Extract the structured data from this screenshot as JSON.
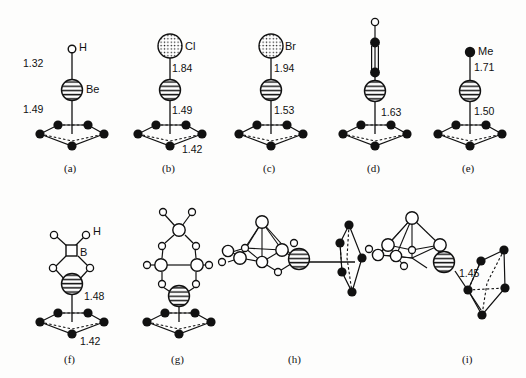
{
  "figure": {
    "caption": "",
    "colors": {
      "line": "#111111",
      "filled_atom": "#111111",
      "open_atom": "#ffffff",
      "background": "#fdfdfc"
    }
  },
  "panels": [
    {
      "id": "a",
      "label": "(a)",
      "formula": "CpBeH",
      "top_atom": {
        "symbol": "H",
        "style": "open-circle",
        "label": "H"
      },
      "metal": {
        "symbol": "Be",
        "style": "striped-sphere",
        "label": "Be"
      },
      "ring": {
        "type": "cyclopentadienyl",
        "atoms": 5,
        "style": "filled-circle"
      },
      "distances": [
        {
          "value": "1.32",
          "from": "Be",
          "to": "H"
        },
        {
          "value": "1.49",
          "from": "Be",
          "to": "ring"
        }
      ]
    },
    {
      "id": "b",
      "label": "(b)",
      "formula": "CpBeCl",
      "top_atom": {
        "symbol": "Cl",
        "style": "stippled-circle",
        "label": "Cl"
      },
      "metal": {
        "symbol": "Be",
        "style": "striped-sphere",
        "label": ""
      },
      "ring": {
        "type": "cyclopentadienyl",
        "atoms": 5,
        "style": "filled-circle"
      },
      "distances": [
        {
          "value": "1.84",
          "from": "Be",
          "to": "Cl"
        },
        {
          "value": "1.49",
          "from": "Be",
          "to": "ring"
        },
        {
          "value": "1.42",
          "from": "C",
          "to": "C"
        }
      ]
    },
    {
      "id": "c",
      "label": "(c)",
      "formula": "CpBeBr",
      "top_atom": {
        "symbol": "Br",
        "style": "stippled-circle",
        "label": "Br"
      },
      "metal": {
        "symbol": "Be",
        "style": "striped-sphere",
        "label": ""
      },
      "ring": {
        "type": "cyclopentadienyl",
        "atoms": 5,
        "style": "filled-circle"
      },
      "distances": [
        {
          "value": "1.94",
          "from": "Be",
          "to": "Br"
        },
        {
          "value": "1.53",
          "from": "Be",
          "to": "ring"
        }
      ]
    },
    {
      "id": "d",
      "label": "(d)",
      "formula": "CpBeC2H",
      "top_atom": {
        "symbol": "H",
        "style": "open-circle",
        "label": ""
      },
      "metal": {
        "symbol": "Be",
        "style": "striped-sphere",
        "label": ""
      },
      "ring": {
        "type": "cyclopentadienyl",
        "atoms": 5,
        "style": "filled-circle"
      },
      "substituent": {
        "type": "acetylide",
        "bond": "triple"
      },
      "distances": [
        {
          "value": "1.63",
          "from": "Be",
          "to": "ring"
        }
      ]
    },
    {
      "id": "e",
      "label": "(e)",
      "formula": "CpBeMe",
      "top_atom": {
        "symbol": "Me",
        "style": "filled-circle",
        "label": "Me"
      },
      "metal": {
        "symbol": "Be",
        "style": "striped-sphere",
        "label": ""
      },
      "ring": {
        "type": "cyclopentadienyl",
        "atoms": 5,
        "style": "filled-circle"
      },
      "distances": [
        {
          "value": "1.71",
          "from": "Be",
          "to": "Me"
        },
        {
          "value": "1.50",
          "from": "Be",
          "to": "ring"
        }
      ]
    },
    {
      "id": "f",
      "label": "(f)",
      "formula": "CpBeBH4",
      "top_atom": {
        "symbol": "B",
        "style": "open-square",
        "label": "B"
      },
      "metal": {
        "symbol": "Be",
        "style": "striped-sphere",
        "label": ""
      },
      "ring": {
        "type": "cyclopentadienyl",
        "atoms": 5,
        "style": "filled-circle"
      },
      "substituent": {
        "type": "borohydride",
        "hydrogen_label": "H"
      },
      "distances": [
        {
          "value": "1.48",
          "from": "Be",
          "to": "ring"
        },
        {
          "value": "1.42",
          "from": "C",
          "to": "C"
        }
      ]
    },
    {
      "id": "g",
      "label": "(g)",
      "formula": "CpBeB3H8",
      "metal": {
        "symbol": "Be",
        "style": "striped-sphere",
        "label": ""
      },
      "ring": {
        "type": "cyclopentadienyl",
        "atoms": 5,
        "style": "filled-circle"
      },
      "substituent": {
        "type": "triborohydride"
      },
      "distances": []
    },
    {
      "id": "h",
      "label": "(h)",
      "formula": "CpBe-borane-cage",
      "metal": {
        "symbol": "Be",
        "style": "striped-sphere",
        "label": ""
      },
      "ring": {
        "type": "cyclopentadienyl",
        "atoms": 5,
        "style": "filled-circle",
        "orientation": "edge-on"
      },
      "substituent": {
        "type": "borane-cage"
      },
      "distances": []
    },
    {
      "id": "i",
      "label": "(i)",
      "formula": "CpBe-borane-cage",
      "metal": {
        "symbol": "Be",
        "style": "striped-sphere",
        "label": ""
      },
      "ring": {
        "type": "cyclopentadienyl",
        "atoms": 5,
        "style": "filled-circle",
        "orientation": "tilted"
      },
      "substituent": {
        "type": "borane-cage"
      },
      "distances": [
        {
          "value": "1.45",
          "from": "Be",
          "to": "ring"
        }
      ]
    }
  ]
}
